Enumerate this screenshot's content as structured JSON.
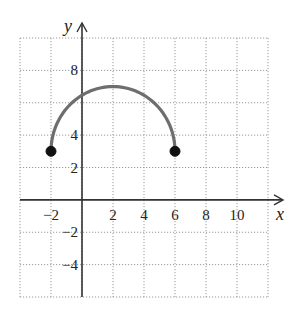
{
  "chart_data": {
    "type": "line",
    "title": "",
    "xlabel": "x",
    "ylabel": "y",
    "xlim": [
      -4,
      12
    ],
    "ylim": [
      -6,
      10
    ],
    "grid": true,
    "grid_step": 2,
    "x_ticks": [
      -2,
      2,
      4,
      6,
      8,
      10
    ],
    "y_ticks": [
      8,
      4,
      2,
      -2,
      -4
    ],
    "x_tick_labels": [
      "−2",
      "2",
      "4",
      "6",
      "8",
      "10"
    ],
    "y_tick_labels": [
      "8",
      "4",
      "2",
      "−2",
      "−4"
    ],
    "series": [
      {
        "name": "upper semicircle",
        "description": "Upper half of circle centered at (2, 3) with radius 4",
        "center": [
          2,
          3
        ],
        "radius": 4,
        "x": [
          -2,
          -1,
          0,
          1,
          2,
          3,
          4,
          5,
          6
        ],
        "y": [
          3,
          5.65,
          6.46,
          6.87,
          7,
          6.87,
          6.46,
          5.65,
          3
        ],
        "color": "#6e6e6e"
      }
    ],
    "endpoints": [
      {
        "x": -2,
        "y": 3,
        "filled": true
      },
      {
        "x": 6,
        "y": 3,
        "filled": true
      }
    ],
    "legend": null
  },
  "colors": {
    "curve": "#6e6e6e",
    "axis": "#333333",
    "grid": "#9a9a9a",
    "point": "#111111"
  }
}
